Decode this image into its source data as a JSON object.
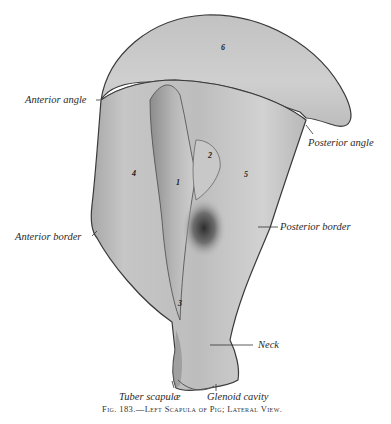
{
  "figure": {
    "caption_prefix": "Fig. 183.",
    "caption_dash": "—",
    "caption_title": "Left Scapula of Pig; Lateral View.",
    "labels": {
      "anterior_angle": "Anterior angle",
      "posterior_angle": "Posterior angle",
      "anterior_border": "Anterior border",
      "posterior_border": "Posterior border",
      "neck": "Neck",
      "tuber_scapulae": "Tuber scapulæ",
      "glenoid_cavity": "Glenoid cavity"
    },
    "numbers": {
      "n1": "1",
      "n2": "2",
      "n3": "3",
      "n4": "4",
      "n5": "5",
      "n6": "6"
    },
    "colors": {
      "bone_light": "#d6d6d6",
      "bone_mid": "#b4b4b4",
      "bone_dark": "#6a6a6a",
      "outline": "#3a3a3a",
      "background": "#ffffff"
    }
  }
}
